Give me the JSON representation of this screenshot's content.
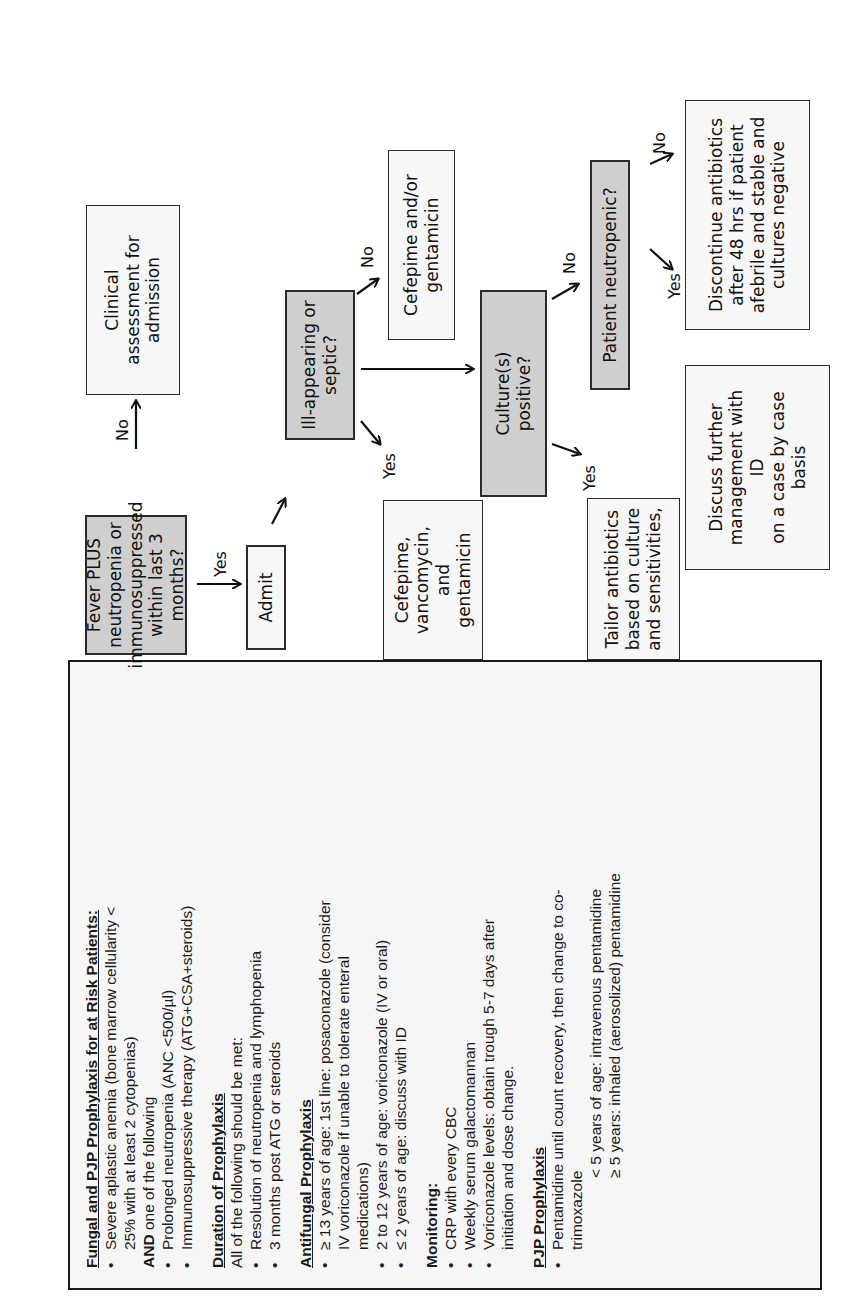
{
  "flowchart": {
    "nodes": {
      "fever": "Fever PLUS\nneutropenia or\nimmunosuppressed\nwithin last 3\nmonths?",
      "clinical": "Clinical\nassessment for\nadmission",
      "admit": "Admit",
      "ill": "Ill-appearing or\nseptic?",
      "cefepime_vanc": "Cefepime,\nvancomycin, and\ngentamicin",
      "cefepime_genta": "Cefepime and/or\ngentamicin",
      "culture": "Culture(s)\npositive?",
      "neutropenic": "Patient neutropenic?",
      "tailor": "Tailor antibiotics\nbased on culture\nand sensitivities,",
      "discuss": "Discuss further\nmanagement with\nID\non a case by case\nbasis",
      "discontinue": "Discontinue antibiotics\nafter 48 hrs if patient\nafebrile and stable and\ncultures negative"
    },
    "labels": {
      "fever_no": "No",
      "fever_yes": "Yes",
      "ill_yes": "Yes",
      "ill_no": "No",
      "culture_yes": "Yes",
      "culture_no": "No",
      "neutro_yes": "Yes",
      "neutro_no": "No"
    }
  },
  "panel": {
    "title": "Fungal and PJP Prophylaxis for at Risk Patients:",
    "criteria": {
      "item1_line1": "Severe aplastic anemia (bone marrow cellularity <",
      "item1_line2": "25% with at least 2 cytopenias)",
      "and_bold": "AND",
      "and_rest": " one of the following",
      "item2": "Prolonged neutropenia (ANC <500/µl)",
      "item3": "Immunosuppressive therapy (ATG+CSA+steroids)"
    },
    "duration": {
      "title": "Duration of Prophylaxis",
      "intro": "All of the following should be met:",
      "items": [
        "Resolution of neutropenia and lymphopenia",
        "3 months post ATG or steroids"
      ]
    },
    "antifungal": {
      "title": "Antifungal Prophylaxis",
      "item1_line1": "≥ 13 years of age: 1st line: posaconazole (consider",
      "item1_line2": "IV voriconazole if unable to tolerate enteral",
      "item1_line3": "medications)",
      "item2": "2 to 12 years of age: voriconazole (IV or oral)",
      "item3": "≤ 2 years of age: discuss with ID"
    },
    "monitoring": {
      "title": "Monitoring:",
      "items": [
        "CRP with every CBC",
        "Weekly serum galactomannan"
      ],
      "item3_line1": "Voriconazole levels: obtain trough 5-7 days after",
      "item3_line2": "initiation and dose change."
    },
    "pjp": {
      "title": "PJP Prophylaxis",
      "item1_line1": "Pentamidine until count recovery, then change to co-",
      "item1_line2": "trimoxazole",
      "sub1": "< 5 years of age: intravenous pentamidine",
      "sub2": "≥ 5 years: inhaled (aerosolized) pentamidine"
    }
  }
}
